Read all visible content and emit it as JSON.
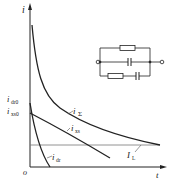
{
  "diagram": {
    "type": "current-time curves with equivalent circuit",
    "axes": {
      "y_label": "i",
      "x_label": "t",
      "origin_label": "o"
    },
    "curves": [
      {
        "id": "i_sum",
        "label_main": "i",
        "label_sub": "Σ",
        "description": "total current"
      },
      {
        "id": "i_xs",
        "label_main": "i",
        "label_sub": "xs",
        "description": "absorption current"
      },
      {
        "id": "i_dr",
        "label_main": "i",
        "label_sub": "dr",
        "description": "capacitive current"
      },
      {
        "id": "I_L",
        "label_main": "I",
        "label_sub": "L",
        "description": "leakage current (constant)"
      }
    ],
    "y_markers": [
      {
        "label_main": "i",
        "label_sub": "dr0"
      },
      {
        "label_main": "i",
        "label_sub": "xs0"
      }
    ],
    "circuit": {
      "branches": [
        "resistor",
        "capacitor",
        "resistor + capacitor in series"
      ],
      "terminals": 2
    },
    "colors": {
      "line": "#222222",
      "leakage_line": "#777777",
      "background": "#ffffff"
    }
  }
}
